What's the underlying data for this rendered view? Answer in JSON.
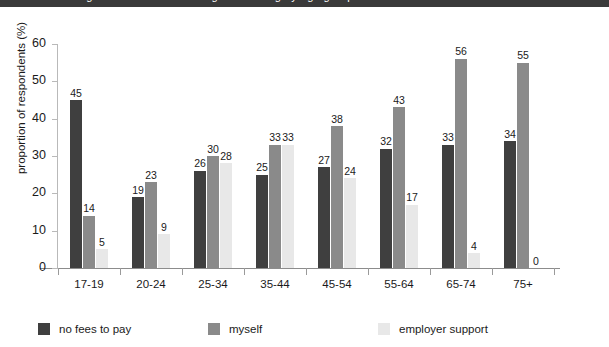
{
  "banner": {
    "text": "figure 7: source of funding for learning by age group"
  },
  "chart_data": {
    "type": "bar",
    "title": "",
    "xlabel": "",
    "ylabel": "proportion of respondents (%)",
    "ylim": [
      0,
      60
    ],
    "yticks": [
      0,
      10,
      20,
      30,
      40,
      50,
      60
    ],
    "ytick_labels": [
      "0",
      "10",
      "20",
      "30",
      "40",
      "50",
      "60"
    ],
    "grid": false,
    "legend_position": "bottom",
    "categories": [
      "17-19",
      "20-24",
      "25-34",
      "35-44",
      "45-54",
      "55-64",
      "65-74",
      "75+"
    ],
    "series": [
      {
        "name": "no fees to pay",
        "color": "#3f3f3f",
        "values": [
          45,
          19,
          26,
          25,
          27,
          32,
          33,
          34
        ],
        "labels": [
          "45",
          "19",
          "26",
          "25",
          "27",
          "32",
          "33",
          "34"
        ]
      },
      {
        "name": "myself",
        "color": "#8a8a8a",
        "values": [
          14,
          23,
          30,
          33,
          38,
          43,
          56,
          55
        ],
        "labels": [
          "14",
          "23",
          "30",
          "33",
          "38",
          "43",
          "56",
          "55"
        ]
      },
      {
        "name": "employer support",
        "color": "#e8e8e8",
        "values": [
          5,
          9,
          28,
          33,
          24,
          17,
          4,
          0
        ],
        "labels": [
          "5",
          "9",
          "28",
          "33",
          "24",
          "17",
          "4",
          "0"
        ]
      }
    ]
  },
  "colors": {
    "axis": "#8c8c8c",
    "text": "#1a1a1a",
    "banner_bg": "#3a3a3a"
  }
}
